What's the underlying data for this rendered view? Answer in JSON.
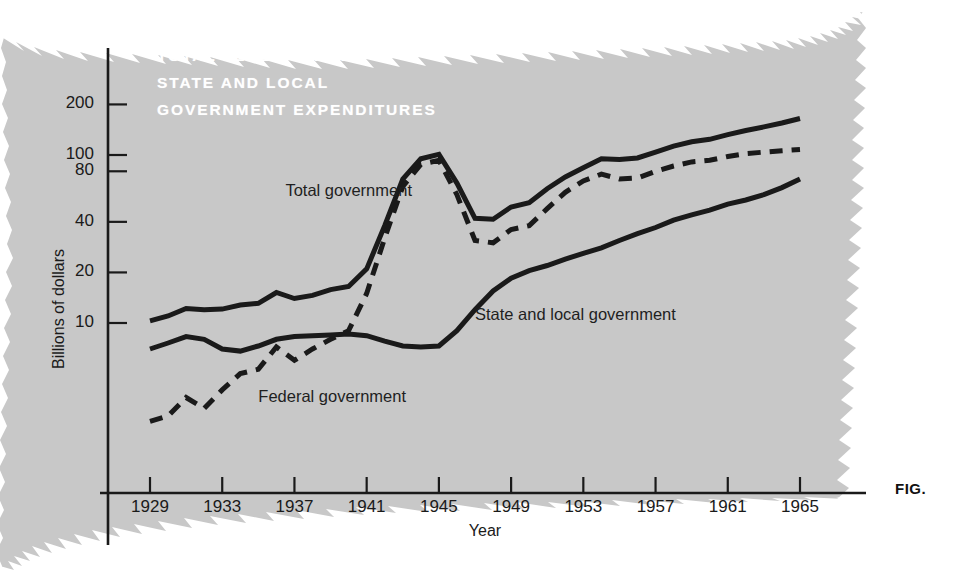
{
  "figure": {
    "caption_label": "FIG.",
    "panel_bg_color": "#c8c8c8",
    "ink_color": "#1a1a1a",
    "title_color": "#ffffff"
  },
  "chart_data": {
    "type": "line",
    "title": "TOTAL FEDERAL AND\nSTATE AND LOCAL\nGOVERNMENT EXPENDITURES",
    "title_lines": [
      "TOTAL FEDERAL AND",
      "STATE AND LOCAL",
      "GOVERNMENT EXPENDITURES"
    ],
    "xlabel": "Year",
    "ylabel": "Billions of dollars",
    "yscale": "log",
    "ylim": [
      1.8,
      260
    ],
    "xlim": [
      1929,
      1966
    ],
    "grid": false,
    "legend_position": "inline-annotations",
    "ytick_labels": [
      "200",
      "100",
      "80",
      "40",
      "20",
      "10"
    ],
    "ytick_values": [
      200,
      100,
      80,
      40,
      20,
      10
    ],
    "xtick_labels": [
      "1929",
      "1933",
      "1937",
      "1941",
      "1945",
      "1949",
      "1953",
      "1957",
      "1961",
      "1965"
    ],
    "xtick_values": [
      1929,
      1933,
      1937,
      1941,
      1945,
      1949,
      1953,
      1957,
      1961,
      1965
    ],
    "x": [
      1929,
      1930,
      1931,
      1932,
      1933,
      1934,
      1935,
      1936,
      1937,
      1938,
      1939,
      1940,
      1941,
      1942,
      1943,
      1944,
      1945,
      1946,
      1947,
      1948,
      1949,
      1950,
      1951,
      1952,
      1953,
      1954,
      1955,
      1956,
      1957,
      1958,
      1959,
      1960,
      1961,
      1962,
      1963,
      1964,
      1965
    ],
    "series": [
      {
        "name": "Total government",
        "style": "solid",
        "color": "#1a1a1a",
        "label": "Total government",
        "values": [
          10.3,
          11.0,
          12.2,
          12.0,
          12.1,
          12.8,
          13.1,
          15.2,
          14.0,
          14.6,
          15.8,
          16.5,
          21.0,
          38.0,
          72.0,
          95.0,
          101.0,
          68.0,
          42.0,
          41.5,
          49.0,
          52.0,
          63.0,
          74.0,
          84.0,
          95.0,
          94.0,
          96.0,
          104.0,
          113.0,
          120.0,
          124.0,
          132.0,
          140.0,
          147.0,
          155.0,
          165.0
        ]
      },
      {
        "name": "Federal government",
        "style": "dashed",
        "color": "#1a1a1a",
        "label": "Federal government",
        "values": [
          2.6,
          2.8,
          3.6,
          3.1,
          4.0,
          5.0,
          5.3,
          7.2,
          6.0,
          7.0,
          8.0,
          9.0,
          15.0,
          32.0,
          65.0,
          88.0,
          93.0,
          58.0,
          31.0,
          30.0,
          36.0,
          38.0,
          48.0,
          60.0,
          70.0,
          77.0,
          72.0,
          73.0,
          80.0,
          86.0,
          91.0,
          93.0,
          98.0,
          102.0,
          104.0,
          106.0,
          108.0
        ]
      },
      {
        "name": "State and local government",
        "style": "solid",
        "color": "#1a1a1a",
        "label": "State and local government",
        "values": [
          7.0,
          7.6,
          8.3,
          8.0,
          7.0,
          6.8,
          7.3,
          8.0,
          8.3,
          8.4,
          8.5,
          8.6,
          8.4,
          7.8,
          7.3,
          7.2,
          7.3,
          9.0,
          12.0,
          15.5,
          18.5,
          20.5,
          22.0,
          24.0,
          26.0,
          28.0,
          31.0,
          34.0,
          37.0,
          41.0,
          44.0,
          47.0,
          51.0,
          54.0,
          58.0,
          64.0,
          72.0
        ]
      }
    ],
    "annotations": [
      {
        "text": "Total government",
        "x": 1936.5,
        "y": 60
      },
      {
        "text": "State and local government",
        "x": 1947.0,
        "y": 11
      },
      {
        "text": "Federal government",
        "x": 1935.0,
        "y": 3.6
      }
    ]
  }
}
